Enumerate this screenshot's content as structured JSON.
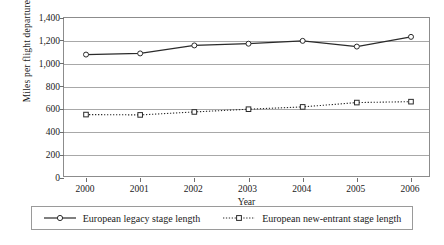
{
  "chart_data": {
    "type": "line",
    "title": "",
    "subtitle": "",
    "xlabel": "Year",
    "ylabel": "Miles per flight departure",
    "categories": [
      "2000",
      "2001",
      "2002",
      "2003",
      "2004",
      "2005",
      "2006"
    ],
    "x": [
      2000,
      2001,
      2002,
      2003,
      2004,
      2005,
      2006
    ],
    "ylim": [
      0,
      1400
    ],
    "ytick_values": [
      0,
      200,
      400,
      600,
      800,
      1000,
      1200,
      1400
    ],
    "ytick_labels": [
      "0",
      "200",
      "400",
      "600",
      "800",
      "1,000",
      "1,200",
      "1,400"
    ],
    "grid": "horizontal",
    "legend_position": "bottom",
    "series": [
      {
        "name": "European legacy stage length",
        "values": [
          1080,
          1090,
          1160,
          1175,
          1200,
          1150,
          1235
        ],
        "line_style": "solid",
        "marker": "open-circle",
        "color": "#2b2b2b"
      },
      {
        "name": "European new-entrant stage length",
        "values": [
          555,
          552,
          578,
          602,
          622,
          660,
          668
        ],
        "line_style": "dotted",
        "marker": "open-square",
        "color": "#2b2b2b"
      }
    ]
  },
  "legend": {
    "items": [
      {
        "label": "European legacy stage length"
      },
      {
        "label": "European new-entrant stage length"
      }
    ]
  }
}
